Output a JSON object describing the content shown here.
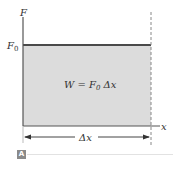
{
  "diagram": {
    "y_axis_label": "F",
    "x_axis_label": "x",
    "force_level_label": "F",
    "force_level_subscript": "0",
    "area_label_prefix": "W = F",
    "area_label_subscript": "0",
    "area_label_suffix": " Δx",
    "displacement_label": "Δx",
    "panel_tag": "A",
    "colors": {
      "area_fill": "#dcdcdc",
      "force_line": "#4a4a4a",
      "axis": "#555555",
      "dashed": "#888888",
      "panel_tag_bg": "#8a8a8a"
    }
  }
}
